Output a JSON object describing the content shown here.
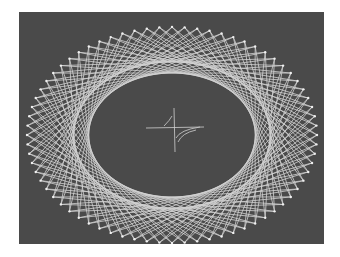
{
  "image": {
    "subject": "string-art-ellipse",
    "background_color": "#4a4a4a",
    "string_color": "#e6e6e6",
    "nail_count": 72,
    "chord_skip": 22,
    "outer_ellipse": {
      "cx": 172,
      "cy": 135,
      "rx": 145,
      "ry": 108
    },
    "center_mark": {
      "x": 173,
      "y": 132
    }
  }
}
